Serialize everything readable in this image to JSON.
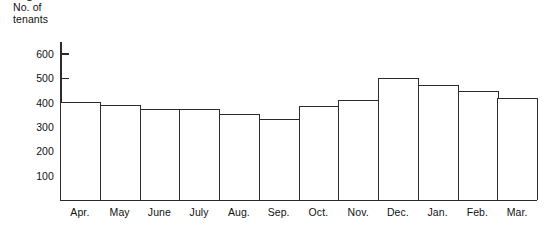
{
  "chart_data": {
    "type": "bar",
    "title": "",
    "ylabel": "No. of tenants",
    "xlabel": "",
    "categories": [
      "Apr.",
      "May",
      "June",
      "July",
      "Aug.",
      "Sep.",
      "Oct.",
      "Nov.",
      "Dec.",
      "Jan.",
      "Feb.",
      "Mar."
    ],
    "values": [
      405,
      390,
      375,
      375,
      355,
      335,
      385,
      410,
      500,
      475,
      450,
      420
    ],
    "ylim": [
      0,
      650
    ],
    "yticks": [
      100,
      200,
      300,
      400,
      500,
      600
    ],
    "ytick_labels": [
      "100",
      "200",
      "300",
      "400",
      "500",
      "600"
    ],
    "grid": false,
    "legend": null,
    "bar_fill_color": "#ffffff",
    "bar_edge_color": "#2b2b2b",
    "axis_color": "#2b2b2b",
    "background_color": "#ffffff"
  },
  "axis_caption": {
    "line1": "No. of",
    "line2": "tenants"
  }
}
